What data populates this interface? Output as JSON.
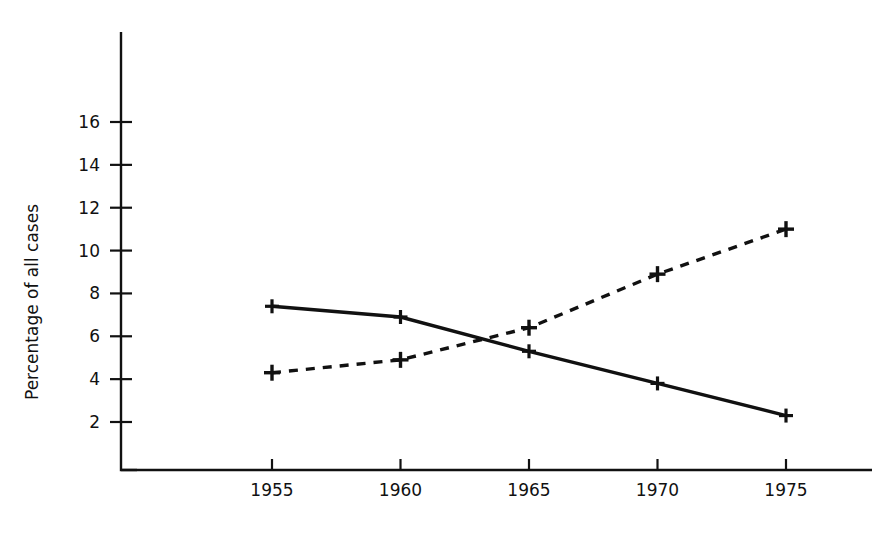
{
  "chart_title": "",
  "axis": {
    "y_title": "Percentage of all cases",
    "x_title": ""
  },
  "chart_data": {
    "type": "line",
    "title": "",
    "xlabel": "",
    "ylabel": "Percentage of all cases",
    "x": [
      1955,
      1960,
      1965,
      1970,
      1975
    ],
    "categories": [
      "1955",
      "1960",
      "1965",
      "1970",
      "1975"
    ],
    "xlim": [
      1953,
      1977
    ],
    "ylim": [
      0,
      18
    ],
    "yticks": [
      2,
      4,
      6,
      8,
      10,
      12,
      14,
      16
    ],
    "ytick_labels": [
      "2",
      "4",
      "6",
      "8",
      "10",
      "12",
      "14",
      "16"
    ],
    "xticks": [
      1955,
      1960,
      1965,
      1970,
      1975
    ],
    "xtick_labels": [
      "1955",
      "1960",
      "1965",
      "1970",
      "1975"
    ],
    "grid": false,
    "legend": "none",
    "series": [
      {
        "name": "solid-series",
        "line_style": "solid",
        "marker": "horizontal-bar",
        "values": [
          7.4,
          6.9,
          5.3,
          3.8,
          2.3
        ]
      },
      {
        "name": "dashed-series",
        "line_style": "dashed",
        "marker": "plus",
        "values": [
          4.3,
          4.9,
          6.4,
          8.9,
          11.0
        ]
      }
    ]
  }
}
